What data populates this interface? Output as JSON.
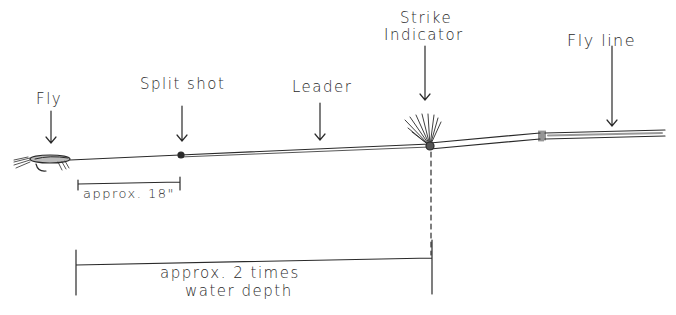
{
  "diagram": {
    "labels": {
      "fly": "Fly",
      "split_shot": "Split shot",
      "leader": "Leader",
      "strike_indicator_line1": "Strike",
      "strike_indicator_line2": "Indicator",
      "fly_line": "Fly line"
    },
    "measurements": {
      "fly_to_split_shot": "approx. 18\"",
      "fly_to_indicator_line1": "approx. 2 times",
      "fly_to_indicator_line2": "water depth"
    },
    "colors": {
      "ink": "#2a2a2a",
      "background": "#ffffff"
    }
  }
}
